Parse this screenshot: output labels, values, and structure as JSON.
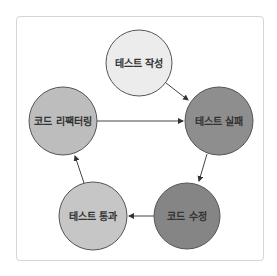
{
  "diagram": {
    "title": "",
    "nodes": [
      {
        "id": "write_test",
        "label": "테스트 작성",
        "cx": 139,
        "cy": 63,
        "r": 33,
        "fill": "#ececec",
        "text_fill": "#3a3a3a"
      },
      {
        "id": "test_fail",
        "label": "테스트 실패",
        "cx": 219,
        "cy": 121,
        "r": 34,
        "fill": "#8e8e8e",
        "text_fill": "#222222"
      },
      {
        "id": "fix_code",
        "label": "코드 수정",
        "cx": 187,
        "cy": 216,
        "r": 33,
        "fill": "#858585",
        "text_fill": "#222222"
      },
      {
        "id": "test_pass",
        "label": "테스트 통과",
        "cx": 93,
        "cy": 216,
        "r": 34,
        "fill": "#c6c6c6",
        "text_fill": "#333333"
      },
      {
        "id": "refactor",
        "label": "코드 리팩터링",
        "cx": 63,
        "cy": 121,
        "r": 34,
        "fill": "#bdbdbd",
        "text_fill": "#333333"
      }
    ],
    "edges": [
      {
        "from": "write_test",
        "to": "test_fail",
        "x1": 166,
        "y1": 83,
        "x2": 188,
        "y2": 100
      },
      {
        "from": "test_fail",
        "to": "fix_code",
        "x1": 207,
        "y1": 154,
        "x2": 199,
        "y2": 181
      },
      {
        "from": "fix_code",
        "to": "test_pass",
        "x1": 154,
        "y1": 216,
        "x2": 129,
        "y2": 216
      },
      {
        "from": "test_pass",
        "to": "refactor",
        "x1": 84,
        "y1": 183,
        "x2": 75,
        "y2": 156
      },
      {
        "from": "refactor",
        "to": "test_fail",
        "x1": 97,
        "y1": 121,
        "x2": 183,
        "y2": 121
      }
    ],
    "colors": {
      "frame_border": "#d6d6d6",
      "node_stroke": "#555555",
      "edge": "#444444"
    }
  }
}
